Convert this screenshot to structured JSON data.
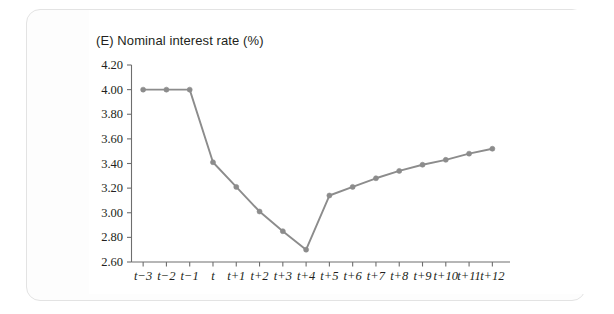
{
  "figure": {
    "title": "(E) Nominal interest rate (%)",
    "panel_label": "(E)"
  },
  "chart_data": {
    "type": "line",
    "title": "(E) Nominal interest rate (%)",
    "xlabel": "",
    "ylabel": "",
    "ylim": [
      2.6,
      4.2
    ],
    "ytick_labels": [
      "2.60",
      "2.80",
      "3.00",
      "3.20",
      "3.40",
      "3.60",
      "3.80",
      "4.00",
      "4.20"
    ],
    "ytick_values": [
      2.6,
      2.8,
      3.0,
      3.2,
      3.4,
      3.6,
      3.8,
      4.0,
      4.2
    ],
    "categories": [
      "t−3",
      "t−2",
      "t−1",
      "t",
      "t+1",
      "t+2",
      "t+3",
      "t+4",
      "t+5",
      "t+6",
      "t+7",
      "t+8",
      "t+9",
      "t+10",
      "t+11",
      "t+12"
    ],
    "values": [
      4.0,
      4.0,
      4.0,
      3.41,
      3.21,
      3.01,
      2.85,
      2.7,
      3.14,
      3.21,
      3.28,
      3.34,
      3.39,
      3.43,
      3.48,
      3.52
    ],
    "series": [
      {
        "name": "Nominal interest rate",
        "values": [
          4.0,
          4.0,
          4.0,
          3.41,
          3.21,
          3.01,
          2.85,
          2.7,
          3.14,
          3.21,
          3.28,
          3.34,
          3.39,
          3.43,
          3.48,
          3.52
        ],
        "color": "#8c8c8c",
        "marker": "circle"
      }
    ],
    "grid": false,
    "legend": "none",
    "line_color": "#8c8c8c",
    "marker_color": "#8c8c8c",
    "axis_color": "#6e6e6e"
  },
  "colors": {
    "page_background": "#ffffff",
    "card_background": "#fdfdfd",
    "card_border": "#e3e3e3",
    "series": "#8c8c8c",
    "axis": "#6e6e6e",
    "text": "#231f20"
  }
}
